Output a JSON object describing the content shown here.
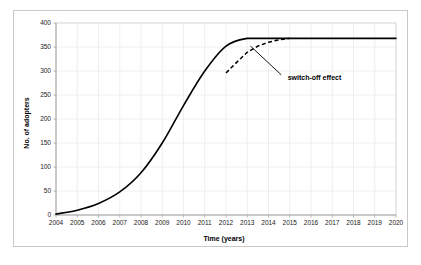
{
  "chart_data": {
    "type": "line",
    "title": "",
    "xlabel": "Time (years)",
    "ylabel": "No. of adopters",
    "xlim": [
      2004,
      2020
    ],
    "ylim": [
      0,
      400
    ],
    "grid": true,
    "legend": "none",
    "x_tick_labels": [
      "2004",
      "2005",
      "2006",
      "2007",
      "2008",
      "2009",
      "2010",
      "2011",
      "2012",
      "2013",
      "2014",
      "2015",
      "2016",
      "2017",
      "2018",
      "2019",
      "2020"
    ],
    "y_tick_labels": [
      "0",
      "50",
      "100",
      "150",
      "200",
      "250",
      "300",
      "350",
      "400"
    ],
    "y_ticks": [
      0,
      50,
      100,
      150,
      200,
      250,
      300,
      350,
      400
    ],
    "x": [
      2004,
      2005,
      2006,
      2007,
      2008,
      2009,
      2010,
      2011,
      2012,
      2013,
      2014,
      2015,
      2016,
      2017,
      2018,
      2019,
      2020
    ],
    "series": [
      {
        "name": "baseline-diffusion",
        "style": "solid",
        "color": "#000000",
        "values": [
          2,
          10,
          24,
          48,
          88,
          150,
          228,
          300,
          352,
          368,
          368,
          368,
          368,
          368,
          368,
          368,
          368
        ]
      },
      {
        "name": "switch-off-scenario",
        "style": "dashed",
        "color": "#000000",
        "x": [
          2012,
          2012.5,
          2013,
          2013.5,
          2014,
          2014.5,
          2015
        ],
        "values": [
          296,
          318,
          339,
          352,
          360,
          365,
          368
        ]
      }
    ],
    "annotations": [
      {
        "name": "switch-off-effect",
        "text": "switch-off effect",
        "text_x": 2014.9,
        "text_y": 286,
        "pointer_from_x": 2014.6,
        "pointer_from_y": 292,
        "pointer_to_x": 2013.15,
        "pointer_to_y": 352
      }
    ],
    "colors": {
      "series_line": "#000000",
      "gridline": "#e4e4e4",
      "axis": "#9a9a9a",
      "frame": "#d0d0d0",
      "background": "#ffffff",
      "outer_border": "#c9c9c9",
      "text": "#000000"
    }
  }
}
